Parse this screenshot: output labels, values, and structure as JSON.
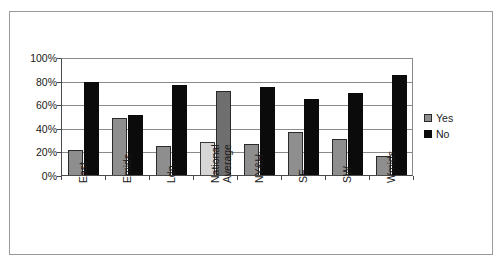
{
  "chart_data": {
    "type": "bar",
    "title": "",
    "xlabel": "",
    "ylabel": "",
    "ylim": [
      0,
      100
    ],
    "ytick_labels": [
      "100%",
      "80%",
      "60%",
      "40%",
      "20%",
      "0%"
    ],
    "ytick_values": [
      100,
      80,
      60,
      40,
      20,
      0
    ],
    "grid": true,
    "legend_position": "right",
    "categories": [
      "East",
      "Emids",
      "Ldn",
      "National Average",
      "NY&H",
      "SE",
      "SW",
      "Wmids"
    ],
    "series": [
      {
        "name": "Yes",
        "color": "#8e8e8e",
        "values": [
          22,
          49,
          25,
          29,
          27,
          37,
          31,
          17
        ]
      },
      {
        "name": "No",
        "color": "#0b0b0b",
        "values": [
          80,
          52,
          77,
          72,
          75,
          65,
          70,
          86
        ]
      }
    ],
    "highlighted_category": "National Average",
    "highlight_colors": {
      "Yes": "#d6d6d6",
      "No": "#6f6f6f"
    }
  },
  "legend": {
    "entries": [
      {
        "label": "Yes",
        "swatch": "yes-swatch"
      },
      {
        "label": "No",
        "swatch": "no-swatch"
      }
    ]
  }
}
